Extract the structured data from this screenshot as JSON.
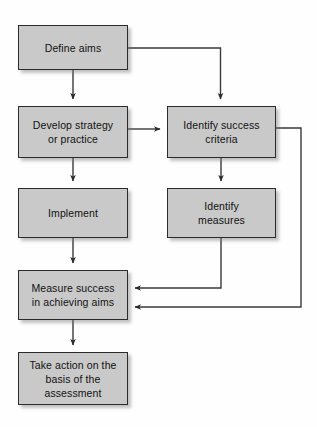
{
  "diagram": {
    "type": "flowchart",
    "background_color": "#fefefe",
    "node_fill_color": "#c9c9c9",
    "node_border_color": "#2b2b2b",
    "connector_color": "#3a3a3a",
    "nodes": [
      {
        "id": "define-aims",
        "label": "Define aims",
        "x": 18,
        "y": 25,
        "w": 110,
        "h": 45
      },
      {
        "id": "develop-strategy",
        "label": "Develop strategy\nor practice",
        "x": 18,
        "y": 106,
        "w": 110,
        "h": 52
      },
      {
        "id": "identify-success-criteria",
        "label": "Identify success\ncriteria",
        "x": 167,
        "y": 106,
        "w": 109,
        "h": 52
      },
      {
        "id": "implement",
        "label": "Implement",
        "x": 18,
        "y": 188,
        "w": 110,
        "h": 50
      },
      {
        "id": "identify-measures",
        "label": "Identify\nmeasures",
        "x": 167,
        "y": 188,
        "w": 109,
        "h": 50
      },
      {
        "id": "measure-success",
        "label": "Measure success\nin achieving aims",
        "x": 18,
        "y": 270,
        "w": 110,
        "h": 50
      },
      {
        "id": "take-action",
        "label": "Take action on the\nbasis of the\nassessment",
        "x": 18,
        "y": 352,
        "w": 110,
        "h": 53
      }
    ],
    "connectors": [
      {
        "id": "define-aims-to-develop-strategy",
        "from": "define-aims",
        "to": "develop-strategy",
        "style": "straight-down"
      },
      {
        "id": "define-aims-to-identify-success-criteria",
        "from": "define-aims",
        "to": "identify-success-criteria",
        "style": "elbow-right-down"
      },
      {
        "id": "develop-strategy-to-identify-success-criteria",
        "from": "develop-strategy",
        "to": "identify-success-criteria",
        "style": "straight-right"
      },
      {
        "id": "develop-strategy-to-implement",
        "from": "develop-strategy",
        "to": "implement",
        "style": "straight-down"
      },
      {
        "id": "identify-success-criteria-to-identify-measures",
        "from": "identify-success-criteria",
        "to": "identify-measures",
        "style": "straight-down"
      },
      {
        "id": "identify-success-criteria-to-measure-success",
        "from": "identify-success-criteria",
        "to": "measure-success",
        "style": "feedback-loop-outer"
      },
      {
        "id": "identify-measures-to-measure-success",
        "from": "identify-measures",
        "to": "measure-success",
        "style": "elbow-down-left"
      },
      {
        "id": "implement-to-measure-success",
        "from": "implement",
        "to": "measure-success",
        "style": "straight-down"
      },
      {
        "id": "measure-success-to-take-action",
        "from": "measure-success",
        "to": "take-action",
        "style": "straight-down"
      }
    ]
  }
}
